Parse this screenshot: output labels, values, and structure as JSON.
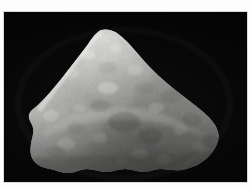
{
  "image": {
    "kind": "photograph",
    "subject": "rock-specimen",
    "subject_description": "Wedge-shaped light gray granular rock fragment, coarsely textured, photographed against a plain black background",
    "colorspace": "grayscale",
    "canvas": {
      "width": 251,
      "height": 190
    },
    "border": {
      "style": "white photographic margin",
      "color": "#fdfdfd",
      "hairline_color": "#d8d8d8"
    },
    "photo_area": {
      "left": 4,
      "top": 12,
      "width": 243,
      "height": 170,
      "background_color": "#050505"
    },
    "specimen": {
      "outline_note": "roughly triangular with rounded right lobe, broad irregular flat base",
      "apex": {
        "x": 100,
        "y": 30
      },
      "leftmost": {
        "x": 30,
        "y": 140
      },
      "rightmost": {
        "x": 219,
        "y": 126
      },
      "base_y_range": [
        158,
        172
      ],
      "tone": {
        "highlight": "#e2e2e0",
        "light": "#c9c9c6",
        "mid": "#a3a3a0",
        "shadow": "#6f6f6e",
        "deep_shadow": "#4a4a49"
      },
      "lighting": "diffuse, slightly upper-left",
      "texture": "granular / sugary crystalline with scattered bright facets and shallow pits"
    }
  },
  "caption": {
    "text": ""
  }
}
